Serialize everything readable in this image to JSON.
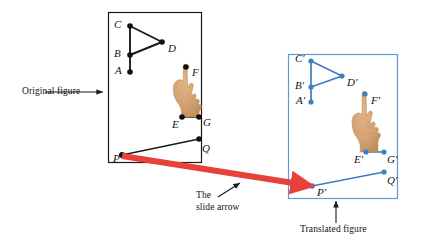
{
  "figure": {
    "annotations": {
      "original": "Original figure",
      "slide_arrow_line1": "The",
      "slide_arrow_line2": "slide arrow",
      "translated": "Translated figure"
    },
    "colors": {
      "original_stroke": "#1a1a1a",
      "translated_stroke": "#3a7fc1",
      "translated_box": "#5b9bd5",
      "slide_arrow": "#e8403a",
      "hand_fill": "#d4a373",
      "hand_outline": "#b8884f",
      "background": "#ffffff"
    },
    "original_panel": {
      "name": "original-figure-panel",
      "box": {
        "x": 108,
        "y": 12,
        "w": 93,
        "h": 150
      },
      "points": [
        {
          "id": "A",
          "label": "A",
          "x": 130,
          "y": 72,
          "label_x": 117,
          "label_y": 67
        },
        {
          "id": "B",
          "label": "B",
          "x": 130,
          "y": 55,
          "label_x": 116,
          "label_y": 50
        },
        {
          "id": "C",
          "label": "C",
          "x": 130,
          "y": 26,
          "label_x": 116,
          "label_y": 21
        },
        {
          "id": "D",
          "label": "D",
          "x": 162,
          "y": 42,
          "label_x": 168,
          "label_y": 45
        },
        {
          "id": "F",
          "label": "F",
          "x": 186,
          "y": 67,
          "label_x": 192,
          "label_y": 72
        },
        {
          "id": "E",
          "label": "E",
          "x": 182,
          "y": 117,
          "label_x": 174,
          "label_y": 121
        },
        {
          "id": "G",
          "label": "G",
          "x": 199,
          "y": 117,
          "label_x": 203,
          "label_y": 121
        },
        {
          "id": "P",
          "label": "P",
          "x": 122,
          "y": 155,
          "label_x": 114,
          "label_y": 153
        },
        {
          "id": "Q",
          "label": "Q",
          "x": 199,
          "y": 139,
          "label_x": 202,
          "label_y": 147
        }
      ],
      "segments": [
        [
          "C",
          "B"
        ],
        [
          "B",
          "A"
        ],
        [
          "C",
          "D"
        ],
        [
          "D",
          "B"
        ],
        [
          "E",
          "G"
        ],
        [
          "P",
          "Q"
        ]
      ]
    },
    "translated_panel": {
      "name": "translated-figure-panel",
      "box": {
        "x": 288,
        "y": 54,
        "w": 109,
        "h": 144
      },
      "points": [
        {
          "id": "A'",
          "label": "A′",
          "x": 311,
          "y": 102,
          "label_x": 297,
          "label_y": 98
        },
        {
          "id": "B'",
          "label": "B′",
          "x": 311,
          "y": 87,
          "label_x": 296,
          "label_y": 83
        },
        {
          "id": "C'",
          "label": "C′",
          "x": 311,
          "y": 61,
          "label_x": 296,
          "label_y": 56
        },
        {
          "id": "D'",
          "label": "D′",
          "x": 342,
          "y": 76,
          "label_x": 347,
          "label_y": 79
        },
        {
          "id": "F'",
          "label": "F′",
          "x": 365,
          "y": 94,
          "label_x": 371,
          "label_y": 99
        },
        {
          "id": "E'",
          "label": "E′",
          "x": 366,
          "y": 152,
          "label_x": 355,
          "label_y": 156
        },
        {
          "id": "G'",
          "label": "G′",
          "x": 384,
          "y": 152,
          "label_x": 387,
          "label_y": 156
        },
        {
          "id": "P'",
          "label": "P′",
          "x": 312,
          "y": 186,
          "label_x": 317,
          "label_y": 192
        },
        {
          "id": "Q'",
          "label": "Q′",
          "x": 384,
          "y": 172,
          "label_x": 387,
          "label_y": 181
        }
      ],
      "segments": [
        [
          "C'",
          "B'"
        ],
        [
          "B'",
          "A'"
        ],
        [
          "C'",
          "D'"
        ],
        [
          "D'",
          "B'"
        ],
        [
          "E'",
          "G'"
        ],
        [
          "P'",
          "Q'"
        ]
      ]
    },
    "slide_arrow": {
      "name": "slide-arrow",
      "from": {
        "x": 122,
        "y": 156
      },
      "to": {
        "x": 312,
        "y": 186
      },
      "width": 6
    },
    "pointer_original": {
      "name": "original-figure-pointer",
      "from": {
        "x": 45,
        "y": 92
      },
      "to": {
        "x": 104,
        "y": 92
      }
    },
    "pointer_slide": {
      "name": "slide-arrow-pointer",
      "from": {
        "x": 218,
        "y": 196
      },
      "to": {
        "x": 238,
        "y": 184
      }
    },
    "pointer_translated": {
      "name": "translated-figure-pointer",
      "from": {
        "x": 336,
        "y": 222
      },
      "to": {
        "x": 336,
        "y": 202
      }
    },
    "label_positions": {
      "original": {
        "x": 22,
        "y": 87
      },
      "slide_arrow": {
        "x": 196,
        "y": 196
      },
      "translated": {
        "x": 302,
        "y": 226
      }
    }
  }
}
